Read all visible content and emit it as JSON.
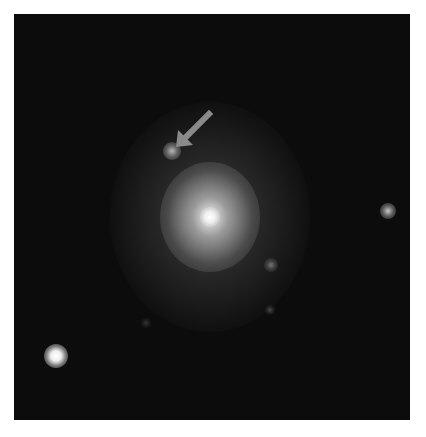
{
  "image": {
    "kind": "astronomical-image",
    "background_color": "#0c0c0c",
    "frame": {
      "x": 14,
      "y": 14,
      "width": 396,
      "height": 406
    },
    "galaxy": {
      "cx": 210,
      "cy": 217,
      "halo_rx": 100,
      "halo_ry": 115,
      "core_color": "#ffffff"
    },
    "sources": [
      {
        "name": "marked-source",
        "cx": 172,
        "cy": 151,
        "r": 7,
        "brightness": 0.55
      },
      {
        "name": "right-star",
        "cx": 388,
        "cy": 211,
        "r": 6,
        "brightness": 0.6
      },
      {
        "name": "bottom-left-star",
        "cx": 56,
        "cy": 356,
        "r": 8,
        "brightness": 1.0
      },
      {
        "name": "faint-source-1",
        "cx": 271,
        "cy": 265,
        "r": 6,
        "brightness": 0.35
      },
      {
        "name": "faint-source-2",
        "cx": 270,
        "cy": 310,
        "r": 4,
        "brightness": 0.2
      },
      {
        "name": "faint-source-3",
        "cx": 146,
        "cy": 323,
        "r": 4,
        "brightness": 0.15
      }
    ],
    "arrow": {
      "color": "#8a8a8a",
      "from": [
        209,
        114
      ],
      "to": [
        180,
        141
      ],
      "points_to": "marked-source"
    }
  }
}
